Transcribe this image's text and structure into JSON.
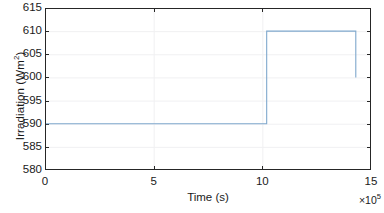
{
  "figure": {
    "background_color": "#ffffff",
    "axes_color": "#262626",
    "grid_color": "#f0f0f2"
  },
  "axis": {
    "ylabel": "Irradiation (Wm",
    "ylabel_sup": "2",
    "ylabel_tail": ")",
    "xlabel": "Time (s)",
    "exponent_prefix": "×10",
    "exponent_power": "5",
    "ytick_labels": [
      "615",
      "610",
      "605",
      "600",
      "595",
      "590",
      "585",
      "580"
    ],
    "xtick_labels": [
      "0",
      "5",
      "10",
      "15"
    ]
  },
  "chart_data": {
    "type": "line",
    "title": "",
    "xlabel": "Time (s)",
    "ylabel": "Irradiation (Wm²)",
    "x_exponent": 100000,
    "xlim": [
      0,
      15
    ],
    "ylim": [
      580,
      615
    ],
    "xticks": [
      0,
      5,
      10,
      15
    ],
    "yticks": [
      580,
      585,
      590,
      595,
      600,
      605,
      610,
      615
    ],
    "grid": true,
    "legend": null,
    "series": [
      {
        "name": "Irradiation",
        "color": "#7fa8cd",
        "line_width": 1.1,
        "x": [
          0,
          10.2,
          10.2,
          14.3,
          14.3
        ],
        "y": [
          590,
          590,
          610,
          610,
          600
        ]
      }
    ],
    "annotations": [
      "Step change from 590 Wm² to 610 Wm² at t ≈ 10.2×10⁵ s",
      "Drop to 600 Wm² at t ≈ 14.3×10⁵ s (end of record)"
    ]
  }
}
